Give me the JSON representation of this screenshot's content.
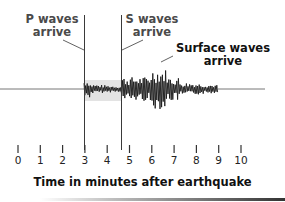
{
  "diagram": {
    "type": "seismogram",
    "annotations": [
      {
        "id": "p_waves",
        "line1": "P waves",
        "line2": "arrive",
        "time_min": 3
      },
      {
        "id": "s_waves",
        "line1": "S waves",
        "line2": "arrive",
        "time_min": 4.7
      },
      {
        "id": "surface_waves",
        "line1": "Surface waves",
        "line2": "arrive",
        "time_min": 6.7
      }
    ],
    "axis": {
      "title": "Time in minutes after earthquake",
      "ticks": [
        "0",
        "1",
        "2",
        "3",
        "4",
        "5",
        "6",
        "7",
        "8",
        "9",
        "10"
      ]
    },
    "colors": {
      "trace": "#1a1a1a",
      "baseline": "#777777",
      "shade": "#e3e3e3",
      "marker_line": "#3a3a3a"
    }
  }
}
